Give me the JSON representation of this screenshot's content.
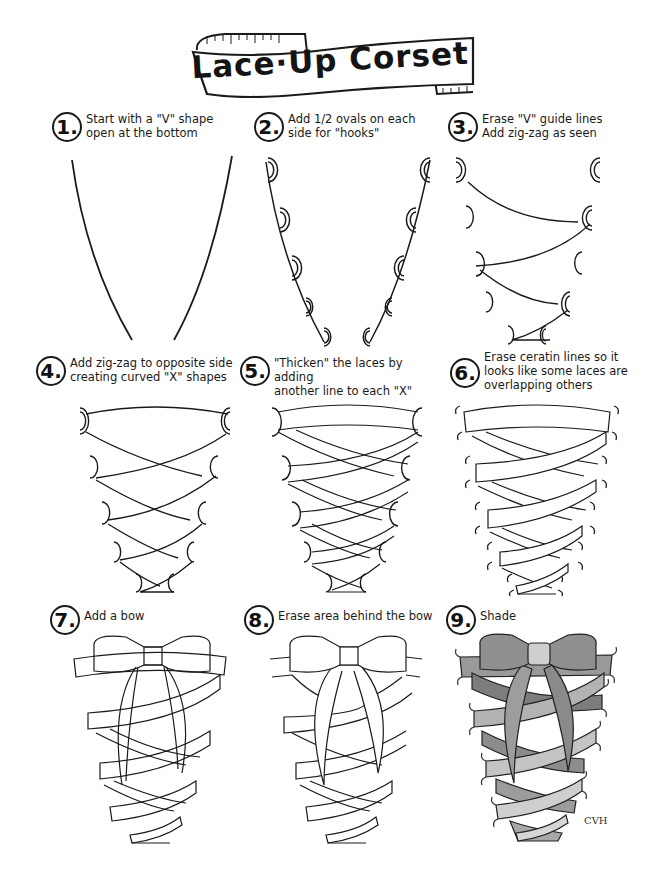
{
  "title": "Lace·Up Corset",
  "steps": [
    {
      "number": "1.",
      "text": "Start with a \"V\" shape\nopen at the bottom"
    },
    {
      "number": "2.",
      "text": "Add 1/2 ovals on each\nside for \"hooks\""
    },
    {
      "number": "3.",
      "text": "Erase \"V\" guide lines\nAdd zig-zag as seen"
    },
    {
      "number": "4.",
      "text": "Add zig-zag to opposite side\ncreating curved \"X\" shapes"
    },
    {
      "number": "5.",
      "text": "\"Thicken\" the laces by adding\nanother line to each \"X\""
    },
    {
      "number": "6.",
      "text": "Erase ceratin lines so it\nlooks like some laces are\noverlapping others"
    },
    {
      "number": "7.",
      "text": "Add a bow"
    },
    {
      "number": "8.",
      "text": "Erase area behind the bow"
    },
    {
      "number": "9.",
      "text": "Shade"
    }
  ],
  "signature": "CVH",
  "colors": {
    "ink": "#1a1a1a",
    "paper": "#ffffff",
    "shade": "#8a8a8a"
  }
}
